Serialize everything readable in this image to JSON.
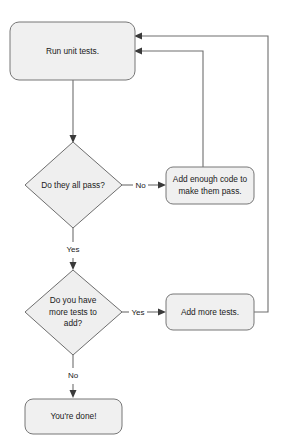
{
  "diagram": {
    "colors": {
      "node_fill": "#f0f0f0",
      "node_stroke": "#777777",
      "edge_stroke": "#6e6e6e",
      "text": "#1a1a1a",
      "background": "#ffffff"
    },
    "nodes": [
      {
        "id": "run-unit-tests",
        "type": "process",
        "label": "Run unit tests."
      },
      {
        "id": "do-they-all-pass",
        "type": "decision",
        "label": "Do they all pass?"
      },
      {
        "id": "add-enough-code",
        "type": "process",
        "label_line1": "Add enough code to",
        "label_line2": "make them pass."
      },
      {
        "id": "do-you-have-more-tests",
        "type": "decision",
        "label_line1": "Do you have",
        "label_line2": "more tests to",
        "label_line3": "add?"
      },
      {
        "id": "add-more-tests",
        "type": "process",
        "label": "Add more tests."
      },
      {
        "id": "youre-done",
        "type": "terminator",
        "label": "You're done!"
      }
    ],
    "edge_labels": {
      "pass_no": "No",
      "pass_yes": "Yes",
      "more_tests_yes": "Yes",
      "more_tests_no": "No"
    }
  }
}
